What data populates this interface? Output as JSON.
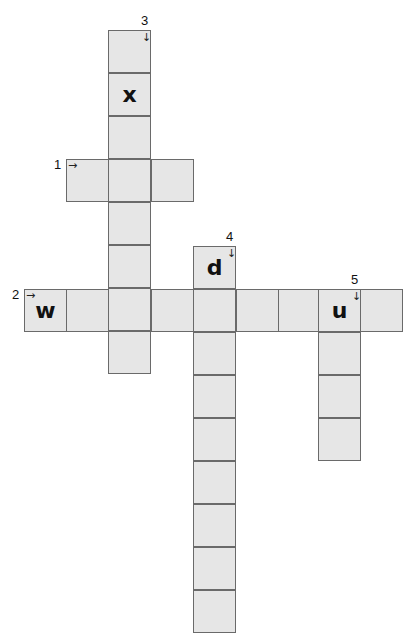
{
  "puzzle": {
    "clues": [
      {
        "number": "1",
        "direction": "across",
        "arrow": "→",
        "x": 66,
        "y": 159,
        "len": 3,
        "letters": [
          "",
          "",
          ""
        ]
      },
      {
        "number": "2",
        "direction": "across",
        "arrow": "→",
        "x": 24,
        "y": 289,
        "len": 9,
        "letters": [
          "w",
          "",
          "",
          "",
          "",
          "",
          "",
          "u",
          ""
        ]
      },
      {
        "number": "3",
        "direction": "down",
        "arrow": "↓",
        "x": 108,
        "y": 30,
        "len": 8,
        "letters": [
          "",
          "x",
          "",
          "",
          "",
          "",
          "",
          ""
        ]
      },
      {
        "number": "4",
        "direction": "down",
        "arrow": "↓",
        "x": 193,
        "y": 246,
        "len": 9,
        "letters": [
          "d",
          "",
          "",
          "",
          "",
          "",
          "",
          "",
          ""
        ]
      },
      {
        "number": "5",
        "direction": "down",
        "arrow": "↓",
        "x": 318,
        "y": 289,
        "len": 4,
        "letters": [
          "u",
          "",
          "",
          ""
        ]
      }
    ]
  }
}
